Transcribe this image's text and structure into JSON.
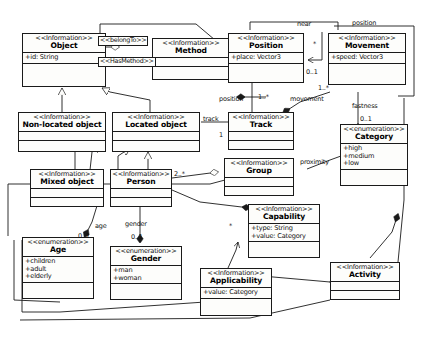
{
  "diagram": {
    "stereotype_information": "<<Information>>",
    "stereotype_enumeration": "<<enumeration>>"
  },
  "classes": [
    {
      "id": "object",
      "stereotype": "<<Information>>",
      "name": "Object",
      "attributes": [
        "+id: String"
      ]
    },
    {
      "id": "method",
      "stereotype": "<<Information>>",
      "name": "Method",
      "attributes": []
    },
    {
      "id": "position",
      "stereotype": "<<Information>>",
      "name": "Position",
      "attributes": [
        "+place: Vector3"
      ]
    },
    {
      "id": "movement",
      "stereotype": "<<Information>>",
      "name": "Movement",
      "attributes": [
        "+speed: Vector3"
      ]
    },
    {
      "id": "nonlocated",
      "stereotype": "<<Information>>",
      "name": "Non-located object",
      "attributes": []
    },
    {
      "id": "located",
      "stereotype": "<<Information>>",
      "name": "Located object",
      "attributes": []
    },
    {
      "id": "track",
      "stereotype": "<<Information>>",
      "name": "Track",
      "attributes": []
    },
    {
      "id": "category",
      "stereotype": "<<enumeration>>",
      "name": "Category",
      "attributes": [
        "+high",
        "+medium",
        "+low"
      ]
    },
    {
      "id": "mixedobject",
      "stereotype": "<<Information>>",
      "name": "Mixed object",
      "attributes": []
    },
    {
      "id": "person",
      "stereotype": "<<Information>>",
      "name": "Person",
      "attributes": []
    },
    {
      "id": "group",
      "stereotype": "<<Information>>",
      "name": "Group",
      "attributes": []
    },
    {
      "id": "capability",
      "stereotype": "<<Information>>",
      "name": "Capability",
      "attributes": [
        "+type: String",
        "+value: Category"
      ]
    },
    {
      "id": "age",
      "stereotype": "<<enumeration>>",
      "name": "Age",
      "attributes": [
        "+children",
        "+adult",
        "+elderly"
      ]
    },
    {
      "id": "gender",
      "stereotype": "<<enumeration>>",
      "name": "Gender",
      "attributes": [
        "+man",
        "+woman"
      ]
    },
    {
      "id": "applicability",
      "stereotype": "<<Information>>",
      "name": "Applicability",
      "attributes": [
        "+value: Category"
      ]
    },
    {
      "id": "activity",
      "stereotype": "<<Information>>",
      "name": "Activity",
      "attributes": []
    }
  ],
  "association_boxes": [
    {
      "id": "belongto",
      "label": "<<belongTo>>"
    },
    {
      "id": "hasmethod",
      "label": "<<HasMethod>>"
    }
  ],
  "edge_labels": [
    {
      "id": "near",
      "text": "near"
    },
    {
      "id": "position_t",
      "text": "position"
    },
    {
      "id": "star_near",
      "text": "*"
    },
    {
      "id": "zeroone_pos",
      "text": "0..1"
    },
    {
      "id": "oneStar_mv",
      "text": "1..*"
    },
    {
      "id": "position_b",
      "text": "position"
    },
    {
      "id": "oneStar_pos",
      "text": "1..*"
    },
    {
      "id": "movement",
      "text": "movement"
    },
    {
      "id": "fastness",
      "text": "fastness"
    },
    {
      "id": "zeroone_fast",
      "text": "0..1"
    },
    {
      "id": "track",
      "text": "track"
    },
    {
      "id": "one_track",
      "text": "1"
    },
    {
      "id": "proximity",
      "text": "proximity"
    },
    {
      "id": "twoStar",
      "text": "2..*"
    },
    {
      "id": "age",
      "text": "age"
    },
    {
      "id": "zeroone_age",
      "text": "0..1"
    },
    {
      "id": "gender",
      "text": "gender"
    },
    {
      "id": "zeroone_gen",
      "text": "0..1"
    },
    {
      "id": "star_cap",
      "text": "*"
    }
  ],
  "colors": {
    "stroke": "#1a1a1a",
    "fill": "#fdfdfb",
    "background": "#ffffff",
    "text": "#111111"
  }
}
